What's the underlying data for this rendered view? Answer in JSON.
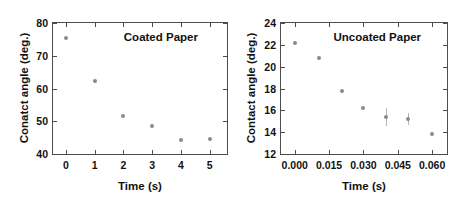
{
  "figure": {
    "panels": [
      "coated",
      "uncoated"
    ]
  },
  "chart_data": [
    {
      "type": "scatter",
      "id": "coated",
      "title": "Coated Paper",
      "xlabel": "Time (s)",
      "ylabel": "Conatct angle (deg.)",
      "xlim": [
        -0.45,
        5.6
      ],
      "ylim": [
        40,
        80
      ],
      "xticks": [
        0,
        1,
        2,
        3,
        4,
        5
      ],
      "xticklabels": [
        "0",
        "1",
        "2",
        "3",
        "4",
        "5"
      ],
      "yticks": [
        40,
        50,
        60,
        70,
        80
      ],
      "yticklabels": [
        "40",
        "50",
        "60",
        "70",
        "80"
      ],
      "grid": false,
      "legend": "none",
      "marker_color": "#8a8a8a",
      "x": [
        0,
        1,
        2,
        3,
        4,
        5
      ],
      "y": [
        75.3,
        62.2,
        51.7,
        48.6,
        44.2,
        44.5
      ],
      "yerr": [
        0,
        0,
        0,
        0,
        0,
        0
      ]
    },
    {
      "type": "scatter",
      "id": "uncoated",
      "title": "Uncoated Paper",
      "xlabel": "Time (s)",
      "ylabel": "Contact angle (deg.)",
      "xlim": [
        -0.006,
        0.0665
      ],
      "ylim": [
        12,
        24
      ],
      "xticks": [
        0.0,
        0.015,
        0.03,
        0.045,
        0.06
      ],
      "xticklabels": [
        "0.000",
        "0.015",
        "0.030",
        "0.045",
        "0.060"
      ],
      "yticks": [
        12,
        14,
        16,
        18,
        20,
        22,
        24
      ],
      "yticklabels": [
        "12",
        "14",
        "16",
        "18",
        "20",
        "22",
        "24"
      ],
      "grid": false,
      "legend": "none",
      "marker_color": "#8a8a8a",
      "x": [
        0.0,
        0.0105,
        0.0205,
        0.03,
        0.04,
        0.0495,
        0.06
      ],
      "y": [
        22.2,
        20.8,
        17.8,
        16.2,
        15.4,
        15.2,
        13.8
      ],
      "yerr": [
        0,
        0,
        0,
        0,
        0.85,
        0.55,
        0
      ]
    }
  ]
}
